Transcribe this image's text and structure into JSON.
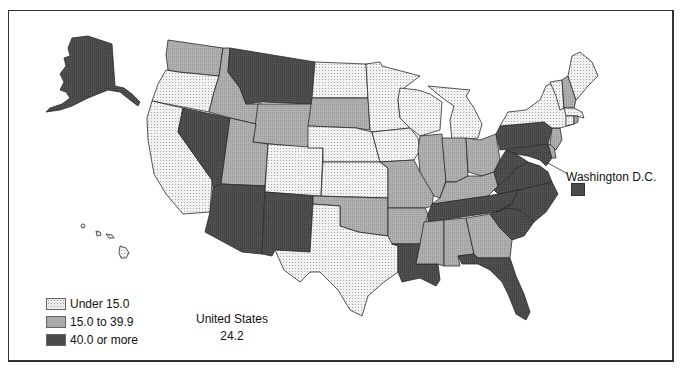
{
  "map": {
    "type": "choropleth",
    "region": "United States",
    "national_value": {
      "label": "United States",
      "value": "24.2"
    },
    "callout": {
      "label": "Washington D.C.",
      "category": "high"
    }
  },
  "legend": {
    "items": [
      {
        "id": "low",
        "label": "Under 15.0",
        "fill": "#e6e6e6"
      },
      {
        "id": "mid",
        "label": "15.0 to 39.9",
        "fill": "#a8a8a8"
      },
      {
        "id": "high",
        "label": "40.0 or more",
        "fill": "#4a4a4a"
      }
    ]
  },
  "colors": {
    "low": "#e9e9e9",
    "mid": "#a9a9a9",
    "high": "#4b4b4b",
    "border": "#2a2a2a",
    "frame": "#333333"
  },
  "states": {
    "low": [
      "Oregon",
      "California",
      "North Dakota",
      "Minnesota",
      "Wisconsin",
      "Michigan",
      "Iowa",
      "Nebraska",
      "Kansas",
      "Colorado",
      "Texas",
      "New York",
      "Vermont",
      "Maine",
      "Massachusetts",
      "Connecticut",
      "Rhode Island",
      "Hawaii"
    ],
    "mid": [
      "Washington",
      "Idaho",
      "Wyoming",
      "Utah",
      "South Dakota",
      "Missouri",
      "Illinois",
      "Indiana",
      "Ohio",
      "Kentucky",
      "Oklahoma",
      "Arkansas",
      "Mississippi",
      "Alabama",
      "Georgia",
      "New Hampshire",
      "New Jersey"
    ],
    "high": [
      "Alaska",
      "Montana",
      "Nevada",
      "Arizona",
      "New Mexico",
      "Pennsylvania",
      "Virginia",
      "West Virginia",
      "North Carolina",
      "South Carolina",
      "Tennessee",
      "Louisiana",
      "Florida",
      "Maryland",
      "Delaware",
      "Washington D.C."
    ]
  }
}
